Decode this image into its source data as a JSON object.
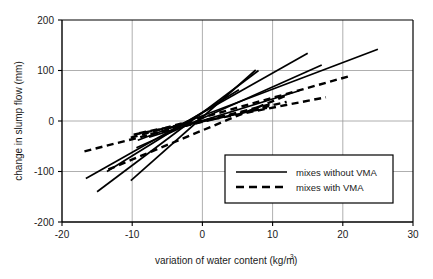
{
  "chart_data": {
    "type": "line",
    "title": "",
    "xlabel": "variation of water content (kg/m3)",
    "xlabel_main": "variation of water content (kg/m",
    "xlabel_sup": "3",
    "xlabel_tail": ")",
    "ylabel": "change in slump flow (mm)",
    "xlim": [
      -20,
      30
    ],
    "ylim": [
      -200,
      200
    ],
    "xticks": [
      -20,
      -10,
      0,
      10,
      20,
      30
    ],
    "xtick_labels": [
      "-20",
      "-10",
      "0",
      "10",
      "20",
      "30"
    ],
    "yticks": [
      -200,
      -100,
      0,
      100,
      200
    ],
    "ytick_labels": [
      "-200",
      "-100",
      "0",
      "100",
      "200"
    ],
    "grid": true,
    "grid_color": "#9a9a9a",
    "axis_color": "#000000",
    "line_color": "#000000",
    "legend_position": "lower-right",
    "legend": [
      {
        "label": "mixes without VMA",
        "style": "solid"
      },
      {
        "label": "mixes with VMA",
        "style": "dashed"
      }
    ],
    "series": [
      {
        "name": "without-VMA-1",
        "style": "solid",
        "x": [
          -15.0,
          8.0
        ],
        "y": [
          -140,
          100
        ]
      },
      {
        "name": "without-VMA-2",
        "style": "solid",
        "x": [
          -10.2,
          7.6
        ],
        "y": [
          -118,
          101
        ]
      },
      {
        "name": "without-VMA-3",
        "style": "solid",
        "x": [
          -13.6,
          5.2
        ],
        "y": [
          -100,
          62
        ]
      },
      {
        "name": "without-VMA-4",
        "style": "solid",
        "x": [
          -16.6,
          15.0
        ],
        "y": [
          -114,
          134
        ]
      },
      {
        "name": "without-VMA-5",
        "style": "solid",
        "x": [
          -9.4,
          17.0
        ],
        "y": [
          -53,
          111
        ]
      },
      {
        "name": "without-VMA-6",
        "style": "solid",
        "x": [
          -9.2,
          25.0
        ],
        "y": [
          -38,
          142
        ]
      },
      {
        "name": "without-VMA-7",
        "style": "solid",
        "x": [
          -7.6,
          13.8
        ],
        "y": [
          -32,
          60
        ]
      },
      {
        "name": "with-VMA-1",
        "style": "dashed",
        "x": [
          -16.8,
          10.2
        ],
        "y": [
          -60,
          35
        ]
      },
      {
        "name": "with-VMA-2",
        "style": "dashed",
        "x": [
          -13.4,
          12.2
        ],
        "y": [
          -96,
          52
        ]
      },
      {
        "name": "with-VMA-3",
        "style": "dashed",
        "x": [
          -10.2,
          21.0
        ],
        "y": [
          -33,
          89
        ]
      },
      {
        "name": "with-VMA-4",
        "style": "dashed",
        "x": [
          -9.8,
          17.6
        ],
        "y": [
          -27,
          47
        ]
      },
      {
        "name": "with-VMA-5",
        "style": "dashed",
        "x": [
          -9.0,
          9.2
        ],
        "y": [
          -24,
          26
        ]
      },
      {
        "name": "with-VMA-6",
        "style": "dashed",
        "x": [
          -7.4,
          12.0
        ],
        "y": [
          -26,
          38
        ]
      }
    ]
  }
}
